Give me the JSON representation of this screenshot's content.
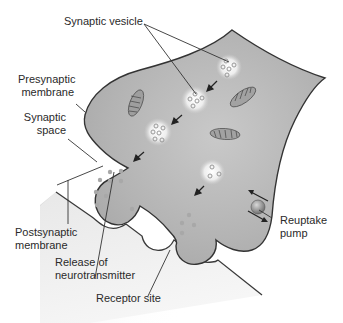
{
  "diagram": {
    "labels": {
      "synaptic_vesicle": "Synaptic vesicle",
      "presynaptic_membrane": "Presynaptic\nmembrane",
      "synaptic_space": "Synaptic\nspace",
      "postsynaptic_membrane": "Postsynaptic\nmembrane",
      "release_of_neurotransmitter": "Release of\nneurotransmitter",
      "receptor_site": "Receptor site",
      "reuptake_pump": "Reuptake\npump"
    },
    "colors": {
      "presynaptic_fill": "#b9b9b9",
      "postsynaptic_fill": "#e6e6e6",
      "outline": "#3a3a3a",
      "vesicle_glow": "#f4f4f4",
      "neurotransmitter_dot": "#9a9a9a",
      "pump": "#8a8a8a",
      "text": "#2a2a2a"
    }
  }
}
